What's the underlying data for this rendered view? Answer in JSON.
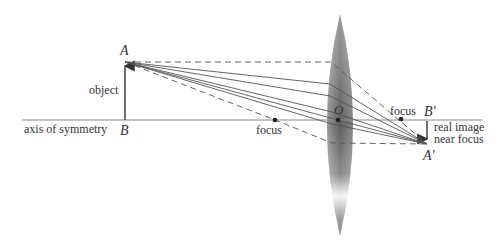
{
  "diagram": {
    "labels": {
      "point_A": "A",
      "point_B": "B",
      "object": "object",
      "axis": "axis of symmetry",
      "focus_left": "focus",
      "center_O": "O",
      "focus_right": "focus",
      "point_B_prime": "B′",
      "point_A_prime": "A′",
      "image_line1": "real image",
      "image_line2": "near focus"
    },
    "colors": {
      "line": "#555555",
      "axis": "#888888",
      "lens_dark": "#6e6e6e",
      "lens_light": "#ffffff"
    }
  }
}
